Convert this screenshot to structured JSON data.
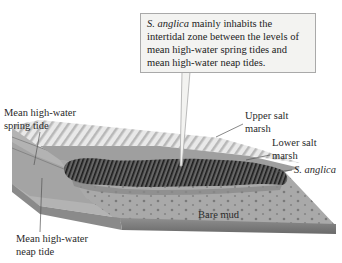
{
  "figure": {
    "type": "illustrated block diagram"
  },
  "callout": {
    "species": "S. anglica",
    "text": " mainly inhabits the intertidal zone between the levels of mean high-water spring tides and mean high-water neap tides.",
    "lines": [
      "S. anglica mainly inhabits the",
      "intertidal zone between the levels",
      "of mean high-water spring tides",
      "and mean high-water neap tides."
    ]
  },
  "labels": {
    "spring_tide": {
      "line1": "Mean high-water",
      "line2": "spring tide"
    },
    "neap_tide": {
      "line1": "Mean high-water",
      "line2": "neap tide"
    },
    "upper_marsh": {
      "line1": "Upper salt",
      "line2": "marsh"
    },
    "lower_marsh": {
      "line1": "Lower salt",
      "line2": "marsh"
    },
    "species": "S. anglica",
    "bare_mud": "Bare mud"
  },
  "colors": {
    "callout_bg": "#f3f3f1",
    "callout_border": "#a9a9a9",
    "ground_light": "#bdbdbd",
    "ground_mid": "#9a9a9a",
    "ground_dark": "#6e6e6e",
    "vegetation_dark": "#2b2b2b",
    "leader_line": "#555555"
  }
}
